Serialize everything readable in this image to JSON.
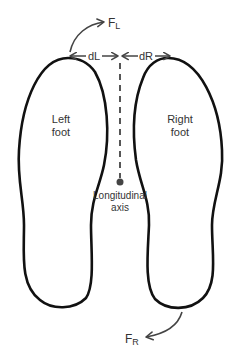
{
  "diagram": {
    "feet": {
      "left": {
        "label_line1": "Left",
        "label_line2": "foot"
      },
      "right": {
        "label_line1": "Right",
        "label_line2": "foot"
      }
    },
    "axis": {
      "label_line1": "Longitudinal",
      "label_line2": "axis"
    },
    "distances": {
      "left": "dL",
      "right": "dR"
    },
    "forces": {
      "left": {
        "main": "F",
        "sub": "L"
      },
      "right": {
        "main": "F",
        "sub": "R"
      }
    },
    "colors": {
      "outline": "#111111",
      "annotation": "#444444",
      "text": "#333333",
      "background": "#ffffff"
    }
  }
}
